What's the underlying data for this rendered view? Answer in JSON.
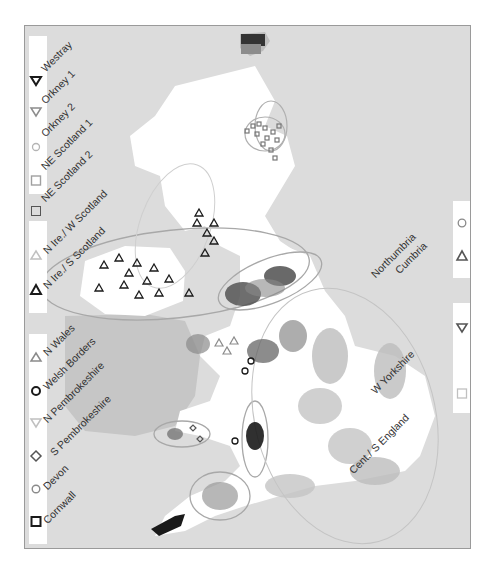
{
  "figure": {
    "type": "map",
    "colors": {
      "sea": "#dcdcdc",
      "land": "#ffffff",
      "ireland_south": "#c6c6c6",
      "ellipse": "#a8a8a8",
      "legend_bg": "#ffffff"
    }
  },
  "legend_left": {
    "groups": [
      {
        "items": [
          {
            "label": "Westray",
            "symbol": "triangle-down",
            "color": "#1a1a1a"
          },
          {
            "label": "Orkney 1",
            "symbol": "triangle-down",
            "color": "#8c8c8c"
          },
          {
            "label": "Orkney 2",
            "symbol": "circle",
            "color": "#b4b4b4"
          },
          {
            "label": "NE Scotland 1",
            "symbol": "square",
            "color": "#a0a0a0"
          },
          {
            "label": "NE Scotland 2",
            "symbol": "square",
            "color": "#555555"
          }
        ]
      },
      {
        "items": [
          {
            "label": "N Ire./ W Scotland",
            "symbol": "triangle-up",
            "color": "#c0c0c0"
          },
          {
            "label": "N Ire./ S Scotland",
            "symbol": "triangle-up",
            "color": "#1a1a1a"
          }
        ]
      },
      {
        "items": [
          {
            "label": "N Wales",
            "symbol": "triangle-up",
            "color": "#8a8a8a"
          },
          {
            "label": "Welsh Borders",
            "symbol": "circle",
            "color": "#1a1a1a"
          },
          {
            "label": "N Pembrokeshire",
            "symbol": "triangle-down",
            "color": "#c0c0c0"
          },
          {
            "label": "S Pembrokeshire",
            "symbol": "diamond",
            "color": "#555555"
          },
          {
            "label": "Devon",
            "symbol": "circle",
            "color": "#8a8a8a"
          },
          {
            "label": "Cornwall",
            "symbol": "square",
            "color": "#1a1a1a"
          }
        ]
      }
    ]
  },
  "legend_right": {
    "groups": [
      {
        "items": [
          {
            "label": "Northumbria",
            "symbol": "circle",
            "color": "#8a8a8a"
          },
          {
            "label": "Cumbria",
            "symbol": "triangle-up",
            "color": "#555555"
          }
        ]
      },
      {
        "items": [
          {
            "label": "W Yorkshire",
            "symbol": "triangle-down",
            "color": "#555555"
          },
          {
            "label": "Cent./ S England",
            "symbol": "square",
            "color": "#c0c0c0"
          }
        ]
      }
    ]
  }
}
